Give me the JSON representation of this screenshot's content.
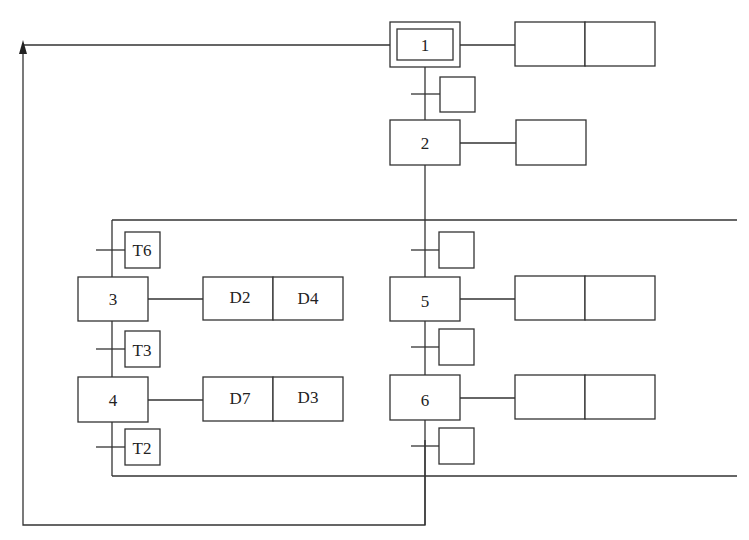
{
  "diagram": {
    "type": "GRAFCET / SFC",
    "steps": [
      {
        "id": "1",
        "label": "1",
        "initial": true,
        "actions": [
          "",
          ""
        ]
      },
      {
        "id": "2",
        "label": "2",
        "actions": [
          ""
        ]
      },
      {
        "id": "3",
        "label": "3",
        "actions": [
          "D2",
          "D4"
        ]
      },
      {
        "id": "4",
        "label": "4",
        "actions": [
          "D7",
          "D3"
        ]
      },
      {
        "id": "5",
        "label": "5",
        "actions": [
          "",
          ""
        ]
      },
      {
        "id": "6",
        "label": "6",
        "actions": [
          "",
          ""
        ]
      }
    ],
    "transitions": [
      {
        "after": "1",
        "label": ""
      },
      {
        "branch_left_entry": "3",
        "label": "T6"
      },
      {
        "after": "3",
        "label": "T3"
      },
      {
        "after": "4",
        "label": "T2"
      },
      {
        "branch_right_entry": "5",
        "label": ""
      },
      {
        "after": "5",
        "label": ""
      },
      {
        "after": "6",
        "label": ""
      }
    ],
    "return_loop": "from bottom of right branch back to step 1"
  }
}
